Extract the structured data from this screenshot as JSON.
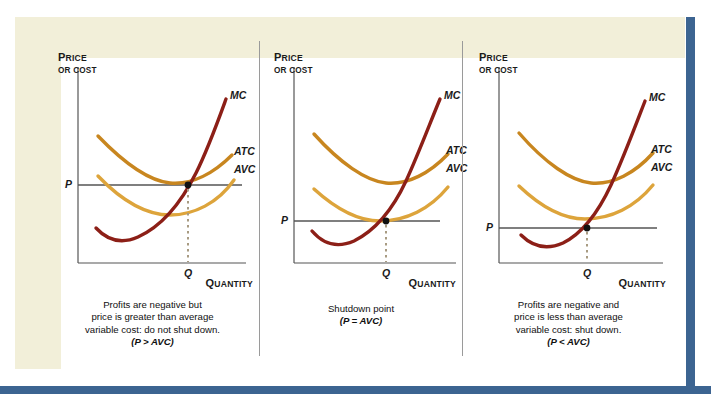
{
  "figure": {
    "background": "#f2efd9",
    "plate": "#ffffff",
    "rule_color": "#3c6491"
  },
  "colors": {
    "mc": "#8c1f17",
    "atc": "#c8861f",
    "avc": "#dda43b",
    "axis": "#555555",
    "price_line": "#555555",
    "dotted": "#a89b82",
    "point": "#111111"
  },
  "axes": {
    "y_label_line1": "Price",
    "y_label_line2": "or Cost",
    "x_label": "Quantity",
    "price_tick": "P",
    "quantity_tick": "Q"
  },
  "curve_labels": {
    "mc": "MC",
    "atc": "ATC",
    "avc": "AVC"
  },
  "panels": [
    {
      "id": "panel-profits-negative-price-above-avc",
      "caption_lines": [
        "Profits are negative but",
        "price is greater than average",
        "variable cost: do not shut down."
      ],
      "condition": "(P > AVC)",
      "price_level": 0.52,
      "quantity": 0.6,
      "note": "P above AVC minimum, below ATC"
    },
    {
      "id": "panel-shutdown-point",
      "caption_lines": [
        "Shutdown point"
      ],
      "condition": "(P = AVC)",
      "price_level": 0.3,
      "quantity": 0.52,
      "note": "P tangent to AVC minimum"
    },
    {
      "id": "panel-profits-negative-price-below-avc",
      "caption_lines": [
        "Profits are negative and",
        "price is less than average",
        "variable cost: shut down."
      ],
      "condition": "(P < AVC)",
      "price_level": 0.22,
      "quantity": 0.48,
      "note": "P below AVC minimum"
    }
  ],
  "chart_data": {
    "type": "line",
    "title": "",
    "xlabel": "Quantity",
    "ylabel": "Price or Cost",
    "grid": false,
    "legend_position": "right-inline",
    "panels": [
      {
        "name": "Profits are negative but price is greater than average variable cost: do not shut down.",
        "condition": "P > AVC",
        "series": [
          {
            "name": "MC",
            "shape": "u-shaped rising steeply",
            "min_y": 0.2,
            "min_x": 0.3
          },
          {
            "name": "ATC",
            "shape": "u-shaped",
            "min_y": 0.52,
            "min_x": 0.58
          },
          {
            "name": "AVC",
            "shape": "u-shaped",
            "min_y": 0.36,
            "min_x": 0.52
          }
        ],
        "price_line_y": 0.52,
        "equilibrium_quantity_x": 0.6,
        "intersection": "MC crosses P at Q, which lies between AVC and ATC"
      },
      {
        "name": "Shutdown point",
        "condition": "P = AVC",
        "series": [
          {
            "name": "MC",
            "shape": "u-shaped rising steeply",
            "min_y": 0.18,
            "min_x": 0.28
          },
          {
            "name": "ATC",
            "shape": "u-shaped",
            "min_y": 0.5,
            "min_x": 0.58
          },
          {
            "name": "AVC",
            "shape": "u-shaped",
            "min_y": 0.3,
            "min_x": 0.52
          }
        ],
        "price_line_y": 0.3,
        "equilibrium_quantity_x": 0.52,
        "intersection": "MC crosses P exactly at the minimum of AVC"
      },
      {
        "name": "Profits are negative and price is less than average variable cost: shut down.",
        "condition": "P < AVC",
        "series": [
          {
            "name": "MC",
            "shape": "u-shaped rising steeply",
            "min_y": 0.16,
            "min_x": 0.28
          },
          {
            "name": "ATC",
            "shape": "u-shaped",
            "min_y": 0.48,
            "min_x": 0.58
          },
          {
            "name": "AVC",
            "shape": "u-shaped",
            "min_y": 0.3,
            "min_x": 0.52
          }
        ],
        "price_line_y": 0.22,
        "equilibrium_quantity_x": 0.48,
        "intersection": "MC crosses P below the minimum of AVC"
      }
    ]
  }
}
